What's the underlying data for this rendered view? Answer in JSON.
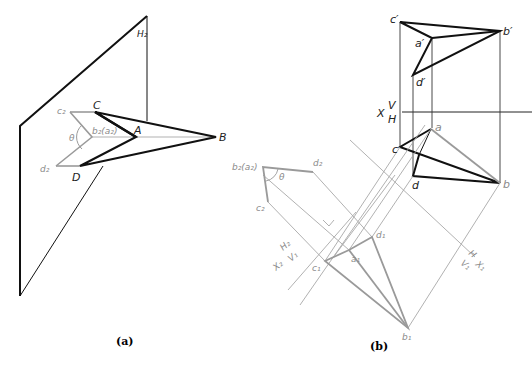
{
  "figure": {
    "panels": [
      {
        "id": "a",
        "caption": "(a)",
        "labels": {
          "plane": "H₂",
          "C": "C",
          "A": "A",
          "B": "B",
          "D": "D",
          "c2": "c₂",
          "d2": "d₂",
          "b2a2": "b₂(a₂)",
          "theta": "θ"
        }
      },
      {
        "id": "b",
        "caption": "(b)",
        "labels": {
          "c_prime": "c′",
          "b_prime": "b′",
          "a_prime": "a′",
          "d_prime": "d′",
          "axis_X": "X",
          "axis_V": "V",
          "axis_H": "H",
          "a": "a",
          "c": "c",
          "d": "d",
          "b": "b",
          "b2a2": "b₂(a₂)",
          "d2": "d₂",
          "c2": "c₂",
          "theta": "θ",
          "axis2_H": "H₂",
          "axis2_V": "V₁",
          "axis2_X": "X₂",
          "axis1_H": "H",
          "axis1_V": "V₁",
          "axis1_X": "X₁",
          "a1": "a₁",
          "c1": "c₁",
          "d1": "d₁",
          "b1": "b₁"
        }
      }
    ],
    "colors": {
      "primary_line": "#111111",
      "secondary_line": "#9a9a9a",
      "construction_line": "#a8a8a8",
      "background": "#ffffff"
    }
  }
}
